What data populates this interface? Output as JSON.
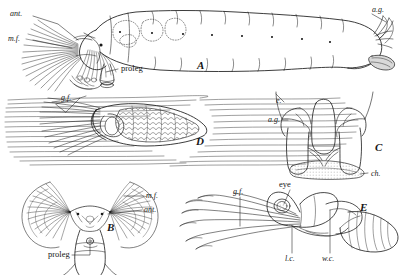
{
  "plate": {
    "background_color": "#ffffff",
    "ink_color": "#1a1a1a",
    "width": 409,
    "height": 275,
    "subject": "black fly (Simuliidae) larva and pupa morphology plate"
  },
  "figures": [
    {
      "key": "A",
      "letter": "A",
      "caption": "larva, lateral view",
      "labels": [
        "ant.",
        "m.f.",
        "proleg",
        "a.g."
      ]
    },
    {
      "key": "B",
      "letter": "B",
      "caption": "larva head, frontal view",
      "labels": [
        "m.f.",
        "ant.",
        "proleg"
      ]
    },
    {
      "key": "C",
      "letter": "C",
      "caption": "posterior end, anal gills",
      "labels": [
        "e.",
        "a.g.",
        "ch."
      ]
    },
    {
      "key": "D",
      "letter": "D",
      "caption": "pupa in net on substrate",
      "labels": [
        "g.f."
      ]
    },
    {
      "key": "E",
      "letter": "E",
      "caption": "pupa, lateral view",
      "labels": [
        "g.f.",
        "eye",
        "l.c.",
        "w.c."
      ]
    }
  ],
  "annotations": {
    "a_ant": "ant.",
    "a_mf": "m.f.",
    "a_proleg": "proleg",
    "a_letter": "A",
    "a_ag": "a.g.",
    "d_gf": "g.f.",
    "d_letter": "D",
    "c_e": "e.",
    "c_ag": "a.g.",
    "c_letter": "C",
    "c_ch": "ch.",
    "b_mf": "m.f.",
    "b_ant": "ant.",
    "b_letter": "B",
    "b_proleg": "proleg",
    "e_gf": "g.f.",
    "e_eye": "eye",
    "e_letter": "E",
    "e_lc": "l.c.",
    "e_wc": "w.c."
  }
}
